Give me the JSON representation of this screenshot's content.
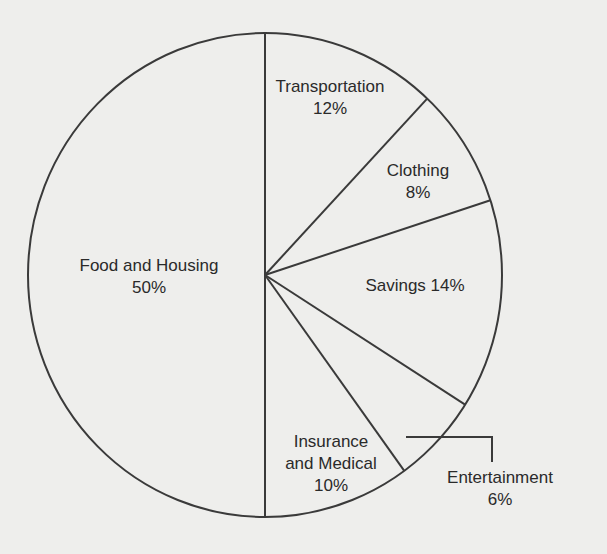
{
  "chart_data": {
    "type": "pie",
    "title": "",
    "start_angle_deg": 0,
    "direction": "clockwise",
    "categories": [
      "Transportation",
      "Clothing",
      "Savings",
      "Entertainment",
      "Insurance and Medical",
      "Food and Housing"
    ],
    "values": [
      12,
      8,
      14,
      6,
      10,
      50
    ],
    "unit": "%",
    "legend": "none",
    "slices": [
      {
        "name": "Transportation",
        "value": 12,
        "label_lines": [
          "Transportation",
          "12%"
        ],
        "label_pos": [
          330,
          92
        ]
      },
      {
        "name": "Clothing",
        "value": 8,
        "label_lines": [
          "Clothing",
          "8%"
        ],
        "label_pos": [
          418,
          176
        ]
      },
      {
        "name": "Savings",
        "value": 14,
        "label_lines": [
          "Savings 14%"
        ],
        "label_pos": [
          415,
          291
        ]
      },
      {
        "name": "Entertainment",
        "value": 6,
        "label_lines": [
          "Entertainment",
          "6%"
        ],
        "label_pos": [
          500,
          483
        ],
        "leader": true
      },
      {
        "name": "Insurance and Medical",
        "value": 10,
        "label_lines": [
          "Insurance",
          "and Medical",
          "10%"
        ],
        "label_pos": [
          331,
          447
        ]
      },
      {
        "name": "Food and Housing",
        "value": 50,
        "label_lines": [
          "Food and Housing",
          "50%"
        ],
        "label_pos": [
          149,
          271
        ]
      }
    ]
  },
  "style": {
    "background": "#eeeeec",
    "stroke": "#3a3a3a",
    "text": "#2a2a2a"
  },
  "geometry": {
    "cx": 265,
    "cy": 275,
    "rx": 237,
    "ry": 242,
    "leader_path": "M406,437 L492,437 L492,462"
  }
}
